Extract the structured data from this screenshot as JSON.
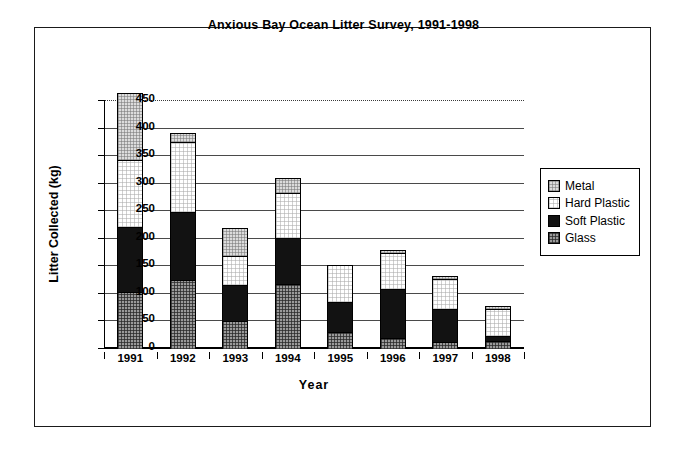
{
  "chart_data": {
    "type": "bar",
    "subtype": "stacked-column",
    "title": "Anxious Bay Ocean Litter Survey, 1991-1998",
    "xlabel": "Year",
    "ylabel": "Litter Collected (kg)",
    "categories": [
      "1991",
      "1992",
      "1993",
      "1994",
      "1995",
      "1996",
      "1997",
      "1998"
    ],
    "ylim": [
      0,
      450
    ],
    "ytick_step": 50,
    "yticks": [
      "450",
      "400",
      "350",
      "300",
      "250",
      "200",
      "150",
      "100",
      "50",
      "0"
    ],
    "grid": true,
    "legend_position": "right",
    "series": [
      {
        "name": "Metal",
        "color": "#dcdcdc",
        "values": [
          120,
          15,
          49,
          25,
          0,
          3,
          4,
          4
        ]
      },
      {
        "name": "Hard Plastic",
        "color": "#ffffff",
        "values": [
          121,
          127,
          51,
          81,
          65,
          67,
          55,
          49
        ]
      },
      {
        "name": "Soft Plastic",
        "color": "#121212",
        "values": [
          119,
          123,
          67,
          84,
          55,
          88,
          60,
          8
        ]
      },
      {
        "name": "Glass",
        "color": "#9a9a9a",
        "values": [
          103,
          125,
          50,
          118,
          30,
          20,
          12,
          15
        ]
      }
    ],
    "stack_order_bottom_to_top": [
      "Glass",
      "Soft Plastic",
      "Hard Plastic",
      "Metal"
    ],
    "totals": [
      463,
      390,
      217,
      308,
      150,
      178,
      131,
      76
    ]
  },
  "legend": {
    "entries": [
      {
        "label": "Metal"
      },
      {
        "label": "Hard Plastic"
      },
      {
        "label": "Soft Plastic"
      },
      {
        "label": "Glass"
      }
    ]
  }
}
